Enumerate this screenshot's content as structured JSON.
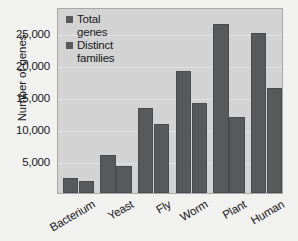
{
  "chart_data": {
    "type": "bar",
    "title": "",
    "subtitle": "",
    "xlabel": "",
    "ylabel": "Number of genes",
    "categories": [
      "Bacterium",
      "Yeast",
      "Fly",
      "Worm",
      "Plant",
      "Human"
    ],
    "series": [
      {
        "name": "Total genes",
        "values": [
          2300,
          6000,
          13300,
          19000,
          26400,
          25000
        ]
      },
      {
        "name": "Distinct families",
        "values": [
          1800,
          4200,
          10800,
          14000,
          11800,
          16400
        ]
      }
    ],
    "ylim": [
      0,
      29000
    ],
    "yticks": [
      5000,
      10000,
      15000,
      20000,
      25000
    ],
    "ytick_labels": [
      "5,000",
      "10,000",
      "15,000",
      "20,000",
      "25,000"
    ],
    "grid": true,
    "grid_axis": "y",
    "legend_position": "top-left-inside",
    "legend_labels": [
      "Total genes",
      "Distinct families"
    ],
    "colors": {
      "series_1": "#58595b",
      "series_2": "#58595b",
      "plot_background": "#d3d3d3",
      "figure_background": "#f1f1ef",
      "gridline": "#e2e2e2",
      "axis_border": "#a8a8a8",
      "text": "#17181a"
    }
  }
}
